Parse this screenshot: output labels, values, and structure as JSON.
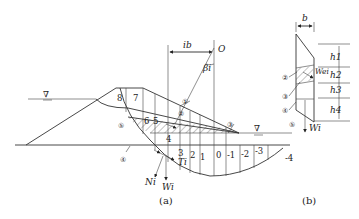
{
  "figure_a": {
    "caption": "(a)",
    "center_label": "O",
    "angle_label": "βi",
    "width_label": "ib",
    "force_labels": {
      "normal": "Ni",
      "weight": "Wi",
      "shear": "Ti"
    },
    "slice_numbers": [
      "8",
      "7",
      "6",
      "5",
      "4",
      "3",
      "2",
      "1",
      "0",
      "-1",
      "-2",
      "-3",
      "-4"
    ],
    "zone_markers": [
      "①",
      "②",
      "③",
      "④",
      "⑤"
    ],
    "water_symbol": "∇"
  },
  "figure_b": {
    "caption": "(b)",
    "width_label": "b",
    "height_labels": [
      "h1",
      "h2",
      "h3",
      "h4"
    ],
    "force_labels": {
      "weight": "Wi",
      "seepage": "Wei"
    },
    "zone_markers": [
      "②",
      "③",
      "④",
      "⑤"
    ]
  }
}
